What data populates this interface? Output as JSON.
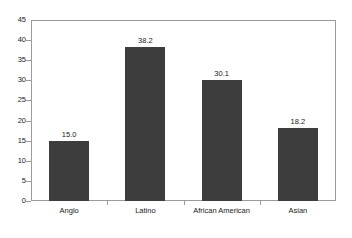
{
  "chart_data": {
    "type": "bar",
    "title": "",
    "subtitle": "",
    "xlabel": "",
    "ylabel": "",
    "categories": [
      "Anglo",
      "Latino",
      "African American",
      "Asian"
    ],
    "values": [
      15.0,
      38.2,
      30.1,
      18.2
    ],
    "data_labels": [
      "15.0",
      "38.2",
      "30.1",
      "18.2"
    ],
    "ylim": [
      0,
      45
    ],
    "ytick_step": 5,
    "ytick_labels": [
      "0",
      "5",
      "10",
      "15",
      "20",
      "25",
      "30",
      "35",
      "40",
      "45"
    ],
    "ytick_values": [
      0,
      5,
      10,
      15,
      20,
      25,
      30,
      35,
      40,
      45
    ],
    "grid": false,
    "legend": false,
    "legend_position": "none",
    "bar_color": "#3d3d3d",
    "frame_color": "#9b9b9b",
    "background_color": "#ffffff",
    "text_color": "#1a1a1a"
  }
}
